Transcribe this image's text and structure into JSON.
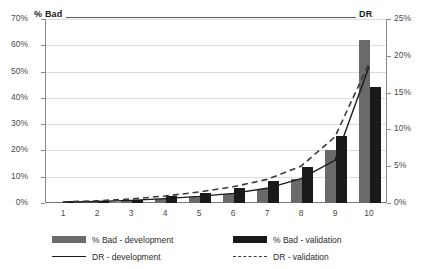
{
  "chart_data": {
    "type": "bar",
    "title": "",
    "xlabel": "",
    "ylabel": "% Bad",
    "y2label": "DR",
    "categories": [
      "1",
      "2",
      "3",
      "4",
      "5",
      "6",
      "7",
      "8",
      "9",
      "10"
    ],
    "ylim": [
      0,
      70
    ],
    "y2lim": [
      0,
      25
    ],
    "yticks": [
      "0%",
      "10%",
      "20%",
      "30%",
      "40%",
      "50%",
      "60%",
      "70%"
    ],
    "y2ticks": [
      "0%",
      "5%",
      "10%",
      "15%",
      "20%",
      "25%"
    ],
    "grid": true,
    "legend_position": "bottom",
    "series": [
      {
        "name": "% Bad - development",
        "type": "bar",
        "axis": "left",
        "color": "#6a6a6a",
        "values": [
          0.5,
          0.8,
          1.0,
          1.5,
          2.4,
          3.6,
          5.5,
          9.3,
          20.2,
          62.0
        ]
      },
      {
        "name": "% Bad - validation",
        "type": "bar",
        "axis": "left",
        "color": "#1a1a1a",
        "values": [
          0.6,
          0.9,
          1.1,
          2.5,
          3.8,
          5.8,
          8.4,
          13.8,
          25.6,
          44.0
        ]
      },
      {
        "name": "DR - development",
        "type": "line",
        "axis": "right",
        "color": "#1a1a1a",
        "style": "solid",
        "values": [
          0.1,
          0.2,
          0.35,
          0.6,
          0.9,
          1.3,
          2.0,
          3.3,
          5.8,
          18.5
        ]
      },
      {
        "name": "DR - validation",
        "type": "line",
        "axis": "right",
        "color": "#3a3a3a",
        "style": "dashed",
        "values": [
          0.15,
          0.3,
          0.55,
          0.95,
          1.5,
          2.2,
          3.2,
          5.0,
          9.0,
          19.0
        ]
      }
    ]
  },
  "legend": {
    "items": [
      {
        "label": "% Bad - development"
      },
      {
        "label": "% Bad - validation"
      },
      {
        "label": "DR - development"
      },
      {
        "label": "DR - validation"
      }
    ]
  }
}
